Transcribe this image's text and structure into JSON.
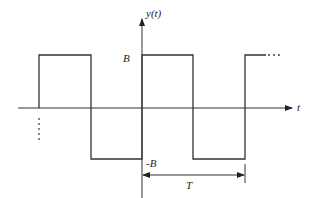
{
  "diagram": {
    "y_axis_label": "y(t)",
    "x_axis_label": "t",
    "high_level_label": "B",
    "low_level_label": "-B",
    "period_label": "T",
    "continuation": "...",
    "colors": {
      "line": "#333333",
      "background": "#ffffff"
    }
  }
}
